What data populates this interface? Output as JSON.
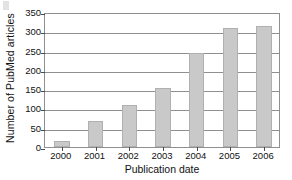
{
  "chart_data": {
    "type": "bar",
    "title": "",
    "xlabel": "Publication date",
    "ylabel": "Number of PubMed articles",
    "categories": [
      "2000",
      "2001",
      "2002",
      "2003",
      "2004",
      "2005",
      "2006"
    ],
    "values": [
      15,
      67,
      110,
      153,
      243,
      308,
      315
    ],
    "series": [
      {
        "name": "Number of PubMed articles",
        "values": [
          15,
          67,
          110,
          153,
          243,
          308,
          315
        ]
      }
    ],
    "ylim": [
      0,
      350
    ],
    "yticks": [
      0,
      50,
      100,
      150,
      200,
      250,
      300,
      350
    ],
    "yticklabels": [
      "0",
      "50",
      "100",
      "150",
      "200",
      "250",
      "300",
      "350"
    ],
    "grid": true,
    "grid_axis": "y",
    "legend": false,
    "legend_position": "none",
    "bar_color": "#c9c9c9",
    "bar_edge_color": "#b0b0b0",
    "axis_color": "#8f8f8f",
    "text_color": "#111111",
    "background_color": "#ffffff"
  }
}
